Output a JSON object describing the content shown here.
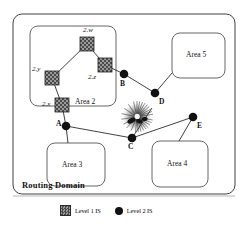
{
  "diagram": {
    "title": "Routing Domain",
    "outer_boundary": {
      "label": "Routing Domain"
    },
    "areas": [
      {
        "id": "area2",
        "label": "Area 2",
        "x": 30,
        "y": 26,
        "w": 86,
        "h": 80
      },
      {
        "id": "area5",
        "label": "Area 5",
        "x": 172,
        "y": 33,
        "w": 53,
        "h": 45
      },
      {
        "id": "area3",
        "label": "Area 3",
        "x": 47,
        "y": 143,
        "w": 58,
        "h": 43
      },
      {
        "id": "area4",
        "label": "Area 4",
        "x": 152,
        "y": 141,
        "w": 56,
        "h": 46
      }
    ],
    "level1_nodes": [
      {
        "id": "2w",
        "label": "2.w",
        "x": 87,
        "y": 44,
        "label_x": 85,
        "label_y": 30
      },
      {
        "id": "2z",
        "label": "2.z",
        "x": 105,
        "y": 65,
        "label_x": 91,
        "label_y": 77
      },
      {
        "id": "2y",
        "label": "2.y",
        "x": 52,
        "y": 78,
        "label_x": 35,
        "label_y": 69
      },
      {
        "id": "2x",
        "label": "2.x",
        "x": 62,
        "y": 105,
        "label_x": 44,
        "label_y": 104
      }
    ],
    "level2_nodes": [
      {
        "id": "A",
        "label": "A",
        "x": 66,
        "y": 126,
        "label_x": 56,
        "label_y": 122
      },
      {
        "id": "B",
        "label": "B",
        "x": 124,
        "y": 74,
        "label_x": 121,
        "label_y": 85
      },
      {
        "id": "C",
        "label": "C",
        "x": 132,
        "y": 138,
        "label_x": 128,
        "label_y": 147
      },
      {
        "id": "D",
        "label": "D",
        "x": 155,
        "y": 93,
        "label_x": 158,
        "label_y": 102
      },
      {
        "id": "E",
        "label": "E",
        "x": 193,
        "y": 117,
        "label_x": 196,
        "label_y": 126
      }
    ],
    "links": [
      {
        "from": "2w",
        "to": "2z"
      },
      {
        "from": "2w",
        "to": "2y"
      },
      {
        "from": "2y",
        "to": "2x"
      },
      {
        "from": "2x",
        "to": "A"
      },
      {
        "from": "2z",
        "to": "B"
      },
      {
        "from": "B",
        "to": "D"
      },
      {
        "from": "D",
        "to": "area5"
      },
      {
        "from": "A",
        "to": "C"
      },
      {
        "from": "A",
        "to": "area3"
      },
      {
        "from": "C",
        "to": "E"
      },
      {
        "from": "E",
        "to": "area4"
      },
      {
        "from": "C",
        "to": "burst"
      }
    ],
    "burst": {
      "name": "network-failure-burst",
      "x": 137,
      "y": 117
    }
  },
  "legend": {
    "items": [
      {
        "symbol": "level1-square",
        "label": "Level 1 IS"
      },
      {
        "symbol": "level2-circle",
        "label": "Level 2 IS"
      }
    ]
  },
  "colors": {
    "line": "#2b2b2b",
    "node_fill": "#111111",
    "square_dark": "#4a4a4a",
    "square_light": "#9a9a9a",
    "background": "#ffffff"
  }
}
